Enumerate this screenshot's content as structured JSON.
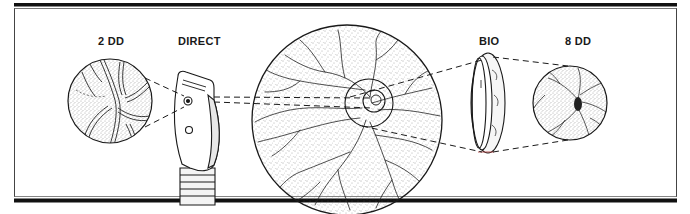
{
  "figure": {
    "labels": {
      "direct_field": "2 DD",
      "direct_instrument": "DIRECT",
      "indirect_instrument": "BIO",
      "indirect_field": "8 DD"
    },
    "colors": {
      "ink": "#1a1a1a",
      "background": "#ffffff",
      "frame_bar": "#111111"
    },
    "elements": [
      {
        "id": "direct-field-view",
        "label_ref": "direct_field",
        "shape": "circle",
        "content": "magnified optic disc and vessels"
      },
      {
        "id": "direct-ophthalmoscope",
        "label_ref": "direct_instrument",
        "shape": "handheld-instrument-head"
      },
      {
        "id": "fundus",
        "shape": "large-circle",
        "content": "retina with branching vessels, optic disc, two concentric field circles"
      },
      {
        "id": "bio-condensing-lens",
        "label_ref": "indirect_instrument",
        "shape": "ring-lens"
      },
      {
        "id": "indirect-field-view",
        "label_ref": "indirect_field",
        "shape": "circle",
        "content": "wide view of optic disc and vessels"
      }
    ]
  }
}
